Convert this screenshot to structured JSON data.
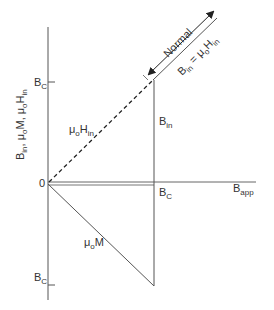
{
  "diagram": {
    "type": "magnetization-diagram",
    "y_axis_label": {
      "parts": [
        "B",
        "in",
        ",  μ",
        "o",
        "M,  μ",
        "o",
        "H",
        "in"
      ]
    },
    "x_axis_label": {
      "base": "B",
      "sub": "app"
    },
    "origin_label": "0",
    "y_tick_upper": {
      "base": "B",
      "sub": "C"
    },
    "y_tick_lower": {
      "base": "B",
      "sub": "C"
    },
    "x_tick_bc": {
      "base": "B",
      "sub": "C"
    },
    "curves": {
      "h_in": {
        "label_base": "μ",
        "label_sub1": "o",
        "label_mid": "H",
        "label_sub2": "in",
        "style": "dashed"
      },
      "b_in": {
        "label_base": "B",
        "label_sub": "in",
        "style": "solid"
      },
      "mu_m": {
        "label_base": "μ",
        "label_sub": "o",
        "label_tail": "M",
        "style": "solid"
      }
    },
    "normal_region": {
      "label": "Normal",
      "equation": {
        "b": "B",
        "b_sub": "in",
        "eq": " = μ",
        "mu_sub": "o",
        "h": "H",
        "h_sub": "in"
      }
    },
    "colors": {
      "line": "#555555",
      "text": "#333333",
      "background": "#ffffff"
    }
  }
}
